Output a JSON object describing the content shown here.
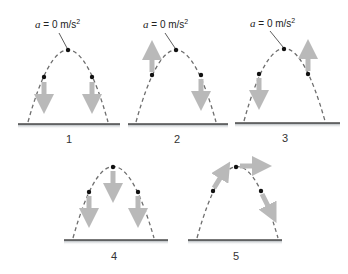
{
  "colors": {
    "path": "#6e6e6e",
    "arrow": "#b9b9b9",
    "dot": "#111111",
    "ground_top": "#4a4a4a",
    "ground_shade": "#a9b0b6"
  },
  "annotation": {
    "var": "a",
    "text": " = 0 m/s",
    "exp": "2"
  },
  "panels": [
    {
      "label": "1",
      "arrows": [
        "down-left",
        "down-right"
      ],
      "apex_annotation": true
    },
    {
      "label": "2",
      "arrows": [
        "up-left",
        "down-right"
      ],
      "apex_annotation": true
    },
    {
      "label": "3",
      "arrows": [
        "down-left",
        "up-right"
      ],
      "apex_annotation": true
    },
    {
      "label": "4",
      "arrows": [
        "down-left",
        "down-apex",
        "down-right"
      ],
      "apex_annotation": false
    },
    {
      "label": "5",
      "arrows": [
        "tangent-left",
        "horizontal-apex",
        "tangent-right"
      ],
      "apex_annotation": false
    }
  ]
}
